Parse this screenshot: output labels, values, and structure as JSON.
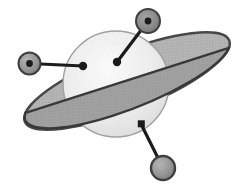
{
  "illustration": {
    "name": "ringed-planet-with-satellite-pins",
    "description": "Grayscale clip-art drawing of a Saturn-like ringed planet with three satellite pin markers attached by lines",
    "background_color": "#ffffff",
    "colors": {
      "ring_fill": "#b6b6b6",
      "ring_front_fill": "#a2a2a2",
      "ring_outline": "#474747",
      "inner_edge_line": "#383838",
      "planet_highlight": "#fcfcfc",
      "planet_mid": "#eeeeee",
      "planet_shade": "#d9d9d9",
      "planet_rim": "#a0a0a0",
      "pin_color": "#1b1b1b",
      "satellite_fill": "#969696",
      "satellite_dark_fill": "#8a8a8a",
      "satellite_outline": "#3e3e3e",
      "stipple_dot": "#4a4a4a"
    },
    "elements": {
      "planet": "planet-sphere",
      "ring_back": "planet-ring-back",
      "ring_front": "planet-ring-front-band",
      "satellites": [
        "satellite-left",
        "satellite-top-right",
        "satellite-bottom-right"
      ],
      "markers": [
        "marker-dot-left",
        "marker-dot-center",
        "marker-square-bottom-right"
      ]
    }
  }
}
